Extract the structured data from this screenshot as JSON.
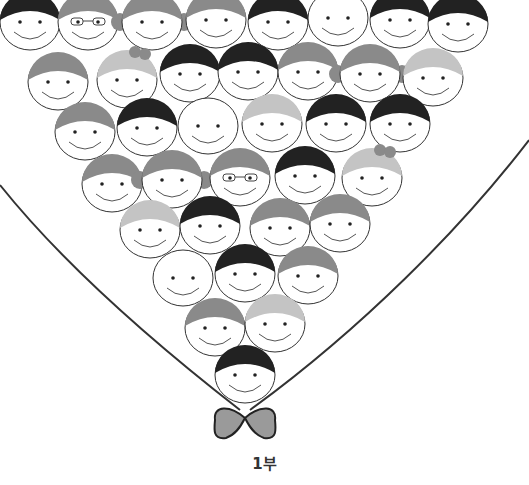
{
  "caption": "1부",
  "colors": {
    "background": "#ffffff",
    "outline": "#333333",
    "hair_dark": "#222222",
    "hair_mid": "#8a8a8a",
    "hair_light": "#c4c4c4",
    "bow_fill": "#9a9a9a"
  },
  "face_radius": 30,
  "faces": [
    {
      "x": 30,
      "y": 22,
      "hair": "dark"
    },
    {
      "x": 88,
      "y": 22,
      "hair": "mid",
      "glasses": true
    },
    {
      "x": 152,
      "y": 22,
      "hair": "mid",
      "buns": true
    },
    {
      "x": 216,
      "y": 20,
      "hair": "mid"
    },
    {
      "x": 278,
      "y": 22,
      "hair": "dark"
    },
    {
      "x": 338,
      "y": 18,
      "hair": "none"
    },
    {
      "x": 400,
      "y": 20,
      "hair": "dark"
    },
    {
      "x": 458,
      "y": 24,
      "hair": "dark"
    },
    {
      "x": 58,
      "y": 82,
      "hair": "mid"
    },
    {
      "x": 127,
      "y": 80,
      "hair": "light",
      "bow": true
    },
    {
      "x": 190,
      "y": 74,
      "hair": "dark"
    },
    {
      "x": 248,
      "y": 72,
      "hair": "dark"
    },
    {
      "x": 308,
      "y": 72,
      "hair": "mid"
    },
    {
      "x": 370,
      "y": 74,
      "hair": "mid",
      "buns": true
    },
    {
      "x": 433,
      "y": 78,
      "hair": "light"
    },
    {
      "x": 85,
      "y": 132,
      "hair": "mid"
    },
    {
      "x": 147,
      "y": 128,
      "hair": "dark"
    },
    {
      "x": 208,
      "y": 126,
      "hair": "none"
    },
    {
      "x": 272,
      "y": 124,
      "hair": "light"
    },
    {
      "x": 336,
      "y": 124,
      "hair": "dark"
    },
    {
      "x": 400,
      "y": 124,
      "hair": "dark"
    },
    {
      "x": 112,
      "y": 184,
      "hair": "mid"
    },
    {
      "x": 172,
      "y": 180,
      "hair": "mid",
      "buns": true
    },
    {
      "x": 240,
      "y": 178,
      "hair": "mid",
      "glasses": true
    },
    {
      "x": 305,
      "y": 176,
      "hair": "dark"
    },
    {
      "x": 372,
      "y": 178,
      "hair": "light",
      "bow": true
    },
    {
      "x": 150,
      "y": 230,
      "hair": "light"
    },
    {
      "x": 210,
      "y": 226,
      "hair": "dark"
    },
    {
      "x": 280,
      "y": 228,
      "hair": "mid"
    },
    {
      "x": 340,
      "y": 224,
      "hair": "mid"
    },
    {
      "x": 183,
      "y": 278,
      "hair": "none"
    },
    {
      "x": 245,
      "y": 274,
      "hair": "dark"
    },
    {
      "x": 308,
      "y": 276,
      "hair": "mid"
    },
    {
      "x": 215,
      "y": 328,
      "hair": "mid"
    },
    {
      "x": 275,
      "y": 324,
      "hair": "light"
    },
    {
      "x": 245,
      "y": 375,
      "hair": "dark"
    }
  ]
}
